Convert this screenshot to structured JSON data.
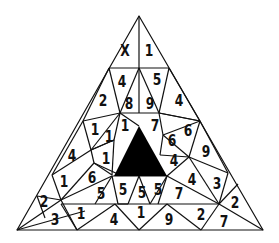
{
  "puzzle": {
    "title": "Number triangle puzzle",
    "missing_symbol": "X",
    "colors": {
      "line": "#111111",
      "fill_center": "#000000",
      "background": "#ffffff"
    },
    "cells": [
      {
        "id": "c01",
        "value": "X",
        "x": 125,
        "y": 51
      },
      {
        "id": "c02",
        "value": "1",
        "x": 149,
        "y": 51
      },
      {
        "id": "c03",
        "value": "4",
        "x": 122,
        "y": 82
      },
      {
        "id": "c04",
        "value": "5",
        "x": 157,
        "y": 80
      },
      {
        "id": "c05",
        "value": "2",
        "x": 103,
        "y": 101
      },
      {
        "id": "c06",
        "value": "8",
        "x": 129,
        "y": 104
      },
      {
        "id": "c07",
        "value": "9",
        "x": 150,
        "y": 104
      },
      {
        "id": "c08",
        "value": "4",
        "x": 179,
        "y": 101
      },
      {
        "id": "c09",
        "value": "1",
        "x": 95,
        "y": 130
      },
      {
        "id": "c10",
        "value": "1",
        "x": 109,
        "y": 137
      },
      {
        "id": "c11",
        "value": "1",
        "x": 125,
        "y": 126
      },
      {
        "id": "c12",
        "value": "7",
        "x": 155,
        "y": 126
      },
      {
        "id": "c13",
        "value": "6",
        "x": 172,
        "y": 141
      },
      {
        "id": "c14",
        "value": "6",
        "x": 188,
        "y": 131
      },
      {
        "id": "c15",
        "value": "9",
        "x": 206,
        "y": 152
      },
      {
        "id": "c16",
        "value": "4",
        "x": 72,
        "y": 156
      },
      {
        "id": "c17",
        "value": "1",
        "x": 106,
        "y": 159
      },
      {
        "id": "c18",
        "value": "4",
        "x": 174,
        "y": 161
      },
      {
        "id": "c19",
        "value": "1",
        "x": 64,
        "y": 182
      },
      {
        "id": "c20",
        "value": "6",
        "x": 92,
        "y": 178
      },
      {
        "id": "c21",
        "value": "4",
        "x": 192,
        "y": 180
      },
      {
        "id": "c22",
        "value": "3",
        "x": 217,
        "y": 184
      },
      {
        "id": "c23",
        "value": "5",
        "x": 101,
        "y": 194
      },
      {
        "id": "c24",
        "value": "5",
        "x": 123,
        "y": 190
      },
      {
        "id": "c25",
        "value": "5",
        "x": 142,
        "y": 193
      },
      {
        "id": "c26",
        "value": "5",
        "x": 158,
        "y": 190
      },
      {
        "id": "c27",
        "value": "7",
        "x": 179,
        "y": 194
      },
      {
        "id": "c28",
        "value": "2",
        "x": 44,
        "y": 202
      },
      {
        "id": "c29",
        "value": "2",
        "x": 235,
        "y": 203
      },
      {
        "id": "c30",
        "value": "3",
        "x": 55,
        "y": 220
      },
      {
        "id": "c31",
        "value": "1",
        "x": 81,
        "y": 214
      },
      {
        "id": "c32",
        "value": "4",
        "x": 114,
        "y": 220
      },
      {
        "id": "c33",
        "value": "1",
        "x": 141,
        "y": 213
      },
      {
        "id": "c34",
        "value": "9",
        "x": 169,
        "y": 220
      },
      {
        "id": "c35",
        "value": "2",
        "x": 201,
        "y": 215
      },
      {
        "id": "c36",
        "value": "7",
        "x": 224,
        "y": 222
      }
    ]
  }
}
